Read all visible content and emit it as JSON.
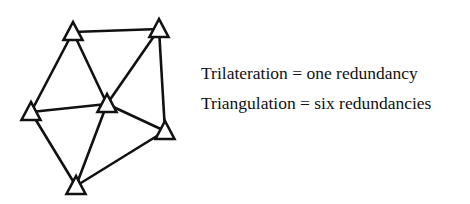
{
  "diagram": {
    "stroke_color": "#111111",
    "stroke_width": 2.6,
    "stations": [
      {
        "id": "A",
        "x": 73,
        "y": 32
      },
      {
        "id": "B",
        "x": 159,
        "y": 29
      },
      {
        "id": "C",
        "x": 31,
        "y": 112
      },
      {
        "id": "D",
        "x": 107,
        "y": 104
      },
      {
        "id": "E",
        "x": 165,
        "y": 131
      },
      {
        "id": "F",
        "x": 76,
        "y": 186
      }
    ],
    "edges": [
      [
        "A",
        "B"
      ],
      [
        "A",
        "C"
      ],
      [
        "A",
        "D"
      ],
      [
        "B",
        "D"
      ],
      [
        "B",
        "E"
      ],
      [
        "C",
        "D"
      ],
      [
        "C",
        "F"
      ],
      [
        "D",
        "F"
      ],
      [
        "D",
        "E"
      ],
      [
        "E",
        "F"
      ]
    ]
  },
  "captions": {
    "trilateration": "Trilateration = one redundancy",
    "triangulation": "Triangulation = six redundancies"
  }
}
